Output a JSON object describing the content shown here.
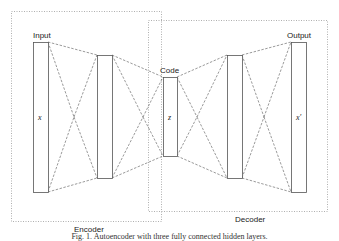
{
  "diagram": {
    "groups": [
      {
        "id": "encoder",
        "label": "Encoder",
        "box": [
          11,
          11,
          162,
          221
        ],
        "label_pos": [
          88,
          231
        ]
      },
      {
        "id": "decoder",
        "label": "Decoder",
        "box": [
          148,
          20,
          328,
          212
        ],
        "label_pos": [
          250,
          221
        ]
      }
    ],
    "layers": [
      {
        "id": "input",
        "label": "Input",
        "var": "x",
        "rect": [
          33,
          42,
          48,
          192
        ]
      },
      {
        "id": "hidden1",
        "label": "",
        "var": "",
        "rect": [
          97,
          55,
          112,
          178
        ]
      },
      {
        "id": "code",
        "label": "Code",
        "var": "z",
        "rect": [
          163,
          77,
          177,
          156
        ]
      },
      {
        "id": "hidden3",
        "label": "",
        "var": "",
        "rect": [
          227,
          55,
          242,
          178
        ]
      },
      {
        "id": "output",
        "label": "Output",
        "var": "x′",
        "rect": [
          291,
          42,
          306,
          192
        ]
      }
    ],
    "connections": "fully connected (dashed) between consecutive layers",
    "colors": {
      "stroke": "#555555",
      "dotted_box": "#9a9a9a",
      "text": "#222222"
    }
  },
  "labels": {
    "input": "Input",
    "code": "Code",
    "output": "Output",
    "x": "x",
    "z": "z",
    "x_prime": "x′",
    "encoder": "Encoder",
    "decoder": "Decoder"
  },
  "caption": "Fig. 1.  Autoencoder with three fully connected hidden layers."
}
